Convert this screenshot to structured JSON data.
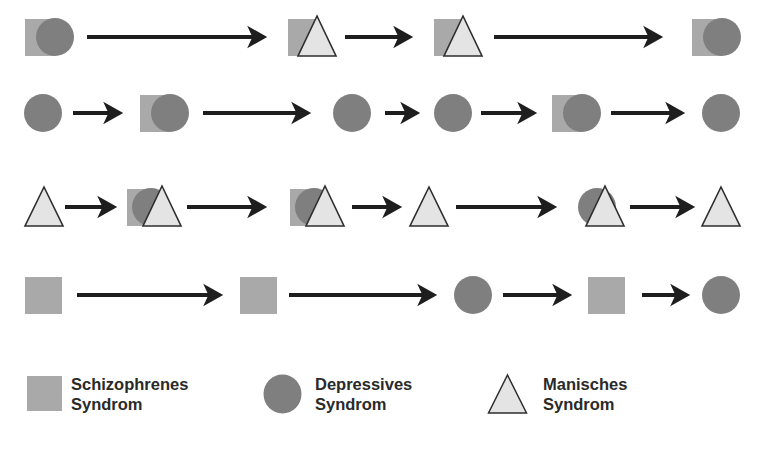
{
  "colors": {
    "schizophrenic": "#a9a9a9",
    "depressive": "#7f7f7f",
    "manic_fill": "#e4e4e4",
    "outline": "#2e2e2e",
    "arrow": "#1e1e1e",
    "background": "#ffffff"
  },
  "symbols": {
    "S": "square",
    "D": "circle",
    "M": "triangle"
  },
  "rows": [
    {
      "y": 37,
      "nodes": [
        {
          "syndromes": [
            "S",
            "D"
          ],
          "x": 25
        },
        {
          "syndromes": [
            "S",
            "M"
          ],
          "x": 288
        },
        {
          "syndromes": [
            "S",
            "M"
          ],
          "x": 434
        },
        {
          "syndromes": [
            "S",
            "D"
          ],
          "x": 692
        }
      ],
      "arrows": [
        [
          87,
          272
        ],
        [
          345,
          418
        ],
        [
          494,
          668
        ]
      ]
    },
    {
      "y": 113,
      "nodes": [
        {
          "syndromes": [
            "D"
          ],
          "x": 24
        },
        {
          "syndromes": [
            "S",
            "D"
          ],
          "x": 140
        },
        {
          "syndromes": [
            "D"
          ],
          "x": 333
        },
        {
          "syndromes": [
            "D"
          ],
          "x": 434
        },
        {
          "syndromes": [
            "S",
            "D"
          ],
          "x": 552
        },
        {
          "syndromes": [
            "D"
          ],
          "x": 702
        }
      ],
      "arrows": [
        [
          73,
          128
        ],
        [
          203,
          316
        ],
        [
          385,
          425
        ],
        [
          481,
          542
        ],
        [
          611,
          690
        ]
      ]
    },
    {
      "y": 207,
      "nodes": [
        {
          "syndromes": [
            "M"
          ],
          "x": 25
        },
        {
          "syndromes": [
            "S",
            "D",
            "M"
          ],
          "x": 127
        },
        {
          "syndromes": [
            "S",
            "D",
            "M"
          ],
          "x": 290
        },
        {
          "syndromes": [
            "M"
          ],
          "x": 410
        },
        {
          "syndromes": [
            "D",
            "M"
          ],
          "x": 578
        },
        {
          "syndromes": [
            "M"
          ],
          "x": 702
        }
      ],
      "arrows": [
        [
          65,
          122
        ],
        [
          187,
          272
        ],
        [
          352,
          407
        ],
        [
          456,
          562
        ],
        [
          630,
          700
        ]
      ]
    },
    {
      "y": 295,
      "nodes": [
        {
          "syndromes": [
            "S"
          ],
          "x": 25
        },
        {
          "syndromes": [
            "S"
          ],
          "x": 240
        },
        {
          "syndromes": [
            "D"
          ],
          "x": 454
        },
        {
          "syndromes": [
            "S"
          ],
          "x": 588
        },
        {
          "syndromes": [
            "D"
          ],
          "x": 702
        }
      ],
      "arrows": [
        [
          77,
          228
        ],
        [
          289,
          442
        ],
        [
          503,
          577
        ],
        [
          642,
          695
        ]
      ]
    }
  ],
  "legend": [
    {
      "symbol": "square",
      "line1": "Schizophrenes",
      "line2": "Syndrom"
    },
    {
      "symbol": "circle",
      "line1": "Depressives",
      "line2": "Syndrom"
    },
    {
      "symbol": "triangle",
      "line1": "Manisches",
      "line2": "Syndrom"
    }
  ]
}
